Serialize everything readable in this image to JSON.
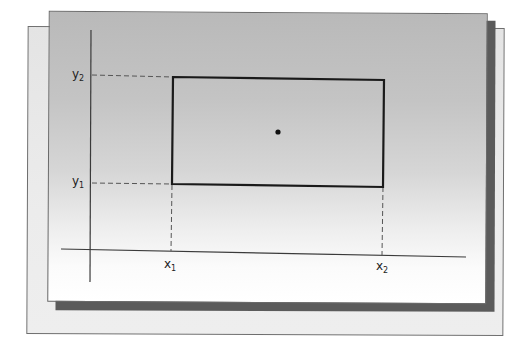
{
  "diagram": {
    "labels": {
      "y2": {
        "base": "y",
        "sub": "2"
      },
      "y1": {
        "base": "y",
        "sub": "1"
      },
      "x1": {
        "base": "x",
        "sub": "1"
      },
      "x2": {
        "base": "x",
        "sub": "2"
      }
    },
    "elements": [
      {
        "type": "axis",
        "orientation": "vertical"
      },
      {
        "type": "axis",
        "orientation": "horizontal"
      },
      {
        "type": "rectangle",
        "corners": [
          "(x1, y1)",
          "(x2, y2)"
        ]
      },
      {
        "type": "point",
        "description": "center of rectangle"
      },
      {
        "type": "dashed-guide",
        "from": "y2",
        "to": "rectangle top-left"
      },
      {
        "type": "dashed-guide",
        "from": "y1",
        "to": "rectangle bottom-left"
      },
      {
        "type": "dashed-guide",
        "from": "x1",
        "to": "rectangle bottom-left"
      },
      {
        "type": "dashed-guide",
        "from": "x2",
        "to": "rectangle bottom-right"
      }
    ],
    "colors": {
      "line": "#1a1a1a",
      "axis": "#3a3a3a",
      "dash": "#555555",
      "page_top": "#b9b9b9",
      "page_bottom": "#ffffff",
      "back_page": "#e6e6e6",
      "shadow": "#5b5b5b"
    }
  }
}
